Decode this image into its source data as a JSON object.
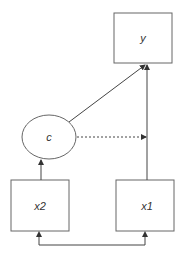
{
  "diagram": {
    "type": "path-diagram",
    "colors": {
      "stroke": "#666666",
      "text": "#333333",
      "background": "#ffffff"
    },
    "nodes": [
      {
        "id": "y",
        "label": "y",
        "shape": "rectangle"
      },
      {
        "id": "c",
        "label": "c",
        "shape": "ellipse"
      },
      {
        "id": "x2",
        "label": "x2",
        "shape": "rectangle"
      },
      {
        "id": "x1",
        "label": "x1",
        "shape": "rectangle"
      }
    ],
    "edges": [
      {
        "from": "c",
        "to": "y",
        "style": "solid",
        "directed": true
      },
      {
        "from": "x1",
        "to": "y",
        "style": "solid",
        "directed": true
      },
      {
        "from": "x2",
        "to": "c",
        "style": "solid",
        "directed": true
      },
      {
        "from": "c",
        "to": "x1-y path",
        "style": "dashed",
        "directed": true
      },
      {
        "from": "x2",
        "to": "x1",
        "style": "solid",
        "directed": "both",
        "note": "covariance"
      }
    ]
  },
  "labels": {
    "y": "y",
    "c": "c",
    "x2": "x2",
    "x1": "x1"
  }
}
